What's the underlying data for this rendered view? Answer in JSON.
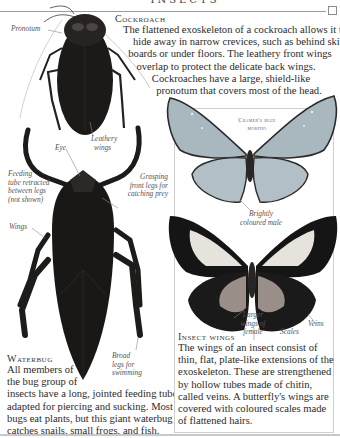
{
  "page": {
    "header_title": "INSECTS",
    "corner_marker": "square"
  },
  "cockroach": {
    "heading": "Cockroach",
    "text_lines": [
      "The flattened exoskeleton of a cockroach allows it to",
      "hide away in narrow crevices, such as behind skirting",
      "boards or under floors. The leathery front wings",
      "overlap to protect the delicate back wings.",
      "Cockroaches have a large, shield-like",
      "pronotum that covers most of the head."
    ],
    "labels": {
      "pronotum": "Pronotum",
      "leathery_wings": [
        "Leathery",
        "wings"
      ]
    }
  },
  "waterbug": {
    "heading": "Waterbug",
    "text": "All members of the bug group of insects have a long, jointed feeding tube, adapted for piercing and sucking. Most bugs eat plants, but this giant waterbug catches snails, small frogs, and fish.",
    "text_lines": [
      "All members of",
      "the bug group of",
      "insects have a long, jointed feeding tube,",
      "adapted for piercing and sucking. Most",
      "bugs eat plants, but this giant waterbug",
      "catches snails, small frogs, and fish."
    ],
    "labels": {
      "eye": "Eye",
      "feeding_tube": [
        "Feeding",
        "tube retracted",
        "between legs",
        "(not shown)"
      ],
      "grasping_legs": [
        "Grasping",
        "front legs for",
        "catching prey"
      ],
      "wings": "Wings",
      "broad_legs": [
        "Broad",
        "legs for",
        "swimming"
      ]
    }
  },
  "butterflies": {
    "male_caption": [
      "Cramer's blue",
      "morpho"
    ],
    "labels": {
      "brightly_coloured_male": [
        "Brightly",
        "coloured male"
      ],
      "larger_wings_female": [
        "Larger",
        "wings of",
        "female"
      ],
      "scales": "Scales",
      "veins": "Veins"
    }
  },
  "insect_wings": {
    "heading": "Insect wings",
    "text_lines": [
      "The wings of an insect consist of",
      "thin, flat, plate-like extensions of the",
      "exoskeleton. These are strengthened",
      "by hollow tubes made of chitin,",
      "called veins. A butterfly's wings are",
      "covered with coloured scales made",
      "of flattened hairs."
    ]
  },
  "colors": {
    "insect_dark": "#1c1a18",
    "morpho_wing": "#a9b7bf",
    "female_dark": "#151515",
    "female_light": "#e6e2dc",
    "rule": "#9a9a9a"
  }
}
